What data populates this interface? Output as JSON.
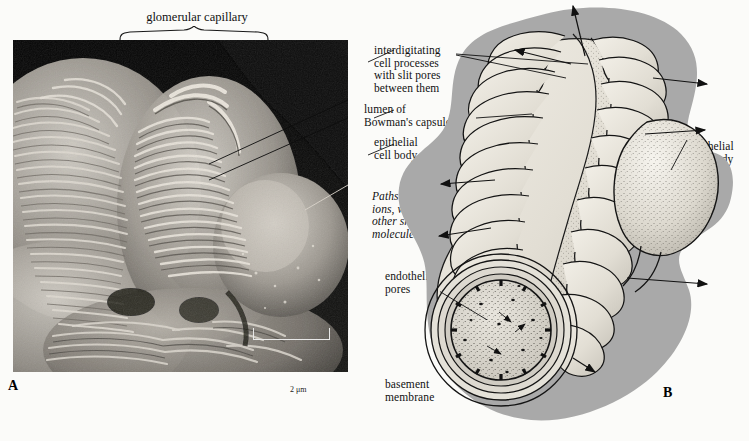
{
  "figure": {
    "panel_a_label": "A",
    "panel_b_label": "B",
    "title": "glomerular capillary",
    "scale_bar": "2 μm",
    "colors": {
      "capsule_gray": "#a9a9a9",
      "process_fill": "#e4e1d8",
      "ink": "#111111",
      "paper": "#fbfbf9",
      "micrograph_dark": "#0c0c0c"
    }
  },
  "labels": {
    "interdigitating": "interdigitating\ncell processes\nwith slit pores\nbetween them",
    "lumen": "lumen of\nBowman's capsule",
    "epithelial_left": "epithelial\ncell body",
    "paths": "Paths of\nions, water,\nother small\nmolecules",
    "endothelial_pores": "endothelial\npores",
    "basement_membrane": "basement\nmembrane",
    "epithelial_right": "epithelial\ncell body"
  }
}
